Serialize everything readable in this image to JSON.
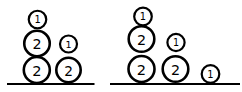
{
  "figure": {
    "background": "#ffffff",
    "stroke_color": "#000000",
    "stroke_width": {
      "small": 2.2,
      "medium": 2.6
    },
    "canvas": {
      "width": 242,
      "height": 92
    },
    "groups": [
      {
        "name": "left-group",
        "line": {
          "x1": 7,
          "x2": 94.5,
          "y": 84,
          "thickness": 2
        },
        "stacks": [
          {
            "name": "stack-2-2-1",
            "circles": [
              {
                "label": "2",
                "size": "medium",
                "cx": 36.8,
                "cy": 70.0,
                "r": 13.0
              },
              {
                "label": "2",
                "size": "medium",
                "cx": 37.0,
                "cy": 43.5,
                "r": 12.75
              },
              {
                "label": "1",
                "size": "small",
                "cx": 37.5,
                "cy": 19.5,
                "r": 8.75
              }
            ]
          },
          {
            "name": "stack-2-1",
            "circles": [
              {
                "label": "2",
                "size": "medium",
                "cx": 68.5,
                "cy": 70.0,
                "r": 12.2
              },
              {
                "label": "1",
                "size": "small",
                "cx": 68.5,
                "cy": 44.0,
                "r": 8.5
              }
            ]
          }
        ]
      },
      {
        "name": "right-group",
        "line": {
          "x1": 110,
          "x2": 240,
          "y": 84,
          "thickness": 2
        },
        "stacks": [
          {
            "name": "stack-2-2-1",
            "circles": [
              {
                "label": "2",
                "size": "medium",
                "cx": 141.5,
                "cy": 69.0,
                "r": 13.0
              },
              {
                "label": "2",
                "size": "medium",
                "cx": 141.5,
                "cy": 39.0,
                "r": 12.8
              },
              {
                "label": "1",
                "size": "small",
                "cx": 143.0,
                "cy": 16.5,
                "r": 8.8
              }
            ]
          },
          {
            "name": "stack-2-1",
            "circles": [
              {
                "label": "2",
                "size": "medium",
                "cx": 175.5,
                "cy": 69.0,
                "r": 12.8
              },
              {
                "label": "1",
                "size": "small",
                "cx": 176.0,
                "cy": 42.5,
                "r": 8.6
              }
            ]
          },
          {
            "name": "stack-1",
            "circles": [
              {
                "label": "1",
                "size": "small",
                "cx": 210.5,
                "cy": 74.0,
                "r": 8.8
              }
            ]
          }
        ]
      }
    ]
  }
}
